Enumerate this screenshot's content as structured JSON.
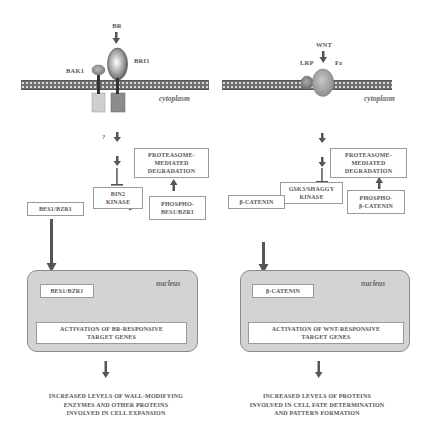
{
  "left_pathway": {
    "ligand": "BR",
    "receptor_main": "BRI1",
    "receptor_co": "BAK1",
    "compartment_label": "cytoplasm",
    "unknown": "?",
    "kinase": "BIN2\nKINASE",
    "degradation": "PROTEASOME-\nMEDIATED\nDEGRADATION",
    "substrate": "BES1/BZR1",
    "phospho": "PHOSPHO-\nBES1/BZR1",
    "nucleus_label": "nucleus",
    "nuclear_factor": "BES1/BZR1",
    "activation": "ACTIVATION OF BR-RESPONSIVE\nTARGET GENES",
    "outcome": "INCREASED LEVELS OF WALL-MODIFYING\nENZYMES AND OTHER PROTEINS\nINVOLVED IN CELL EXPANSION"
  },
  "right_pathway": {
    "ligand": "WNT",
    "receptor_main": "Fz",
    "receptor_co": "LRP",
    "compartment_label": "cytoplasm",
    "kinase": "GSK3/SHAGGY\nKINASE",
    "degradation": "PROTEASOME-\nMEDIATED\nDEGRADATION",
    "substrate": "β-CATENIN",
    "phospho": "PHOSPHO-\nβ-CATENIN",
    "nucleus_label": "nucleus",
    "nuclear_factor": "β-CATENIN",
    "activation": "ACTIVATION OF WNT-RESPONSIVE\nTARGET GENES",
    "outcome": "INCREASED LEVELS OF PROTEINS\nINVOLVED IN CELL FATE DETERMINATION\nAND PATTERN FORMATION"
  },
  "colors": {
    "arrow": "#555555",
    "membrane": "#6f6f6f",
    "nucleus_fill": "#d3d3d3",
    "box_border": "#9a9a9a",
    "text": "#555555"
  }
}
